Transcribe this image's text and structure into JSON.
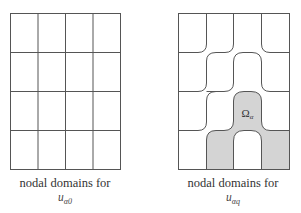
{
  "figure": {
    "left_panel": {
      "caption_line1": "nodal domains for",
      "caption_var": "u",
      "caption_sub": "α0",
      "grid": {
        "rows": 4,
        "cols": 4
      }
    },
    "right_panel": {
      "caption_line1": "nodal domains for",
      "caption_var": "u",
      "caption_sub": "αq",
      "region_label": "Ω",
      "region_label_sub": "α",
      "shaded_color": "#d4d4d4"
    },
    "line_color": "#555555"
  }
}
